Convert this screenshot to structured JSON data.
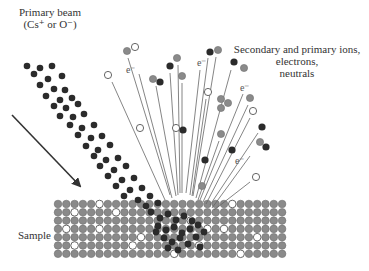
{
  "labels": {
    "primary_beam": "Primary beam",
    "primary_beam_species": "(Cs⁺ or O⁻)",
    "emitted_line1": "Secondary and primary ions,",
    "emitted_line2": "electrons,",
    "emitted_line3": "neutrals",
    "sample": "Sample",
    "electron": "e⁻"
  },
  "colors": {
    "dark_particle": "#2b2b2b",
    "gray_particle": "#8a8a8a",
    "open_particle_stroke": "#555555",
    "trajectory": "#666666",
    "arrow": "#333333"
  },
  "diagram": {
    "beam_arrow": {
      "x1": 12,
      "y1": 115,
      "x2": 80,
      "y2": 186
    },
    "beam_particles": [
      [
        27,
        66
      ],
      [
        40,
        68
      ],
      [
        52,
        66
      ],
      [
        34,
        74
      ],
      [
        48,
        79
      ],
      [
        62,
        76
      ],
      [
        40,
        85
      ],
      [
        54,
        89
      ],
      [
        65,
        90
      ],
      [
        46,
        96
      ],
      [
        60,
        100
      ],
      [
        72,
        98
      ],
      [
        54,
        106
      ],
      [
        66,
        108
      ],
      [
        78,
        104
      ],
      [
        60,
        116
      ],
      [
        73,
        117
      ],
      [
        84,
        114
      ],
      [
        70,
        125
      ],
      [
        82,
        128
      ],
      [
        94,
        125
      ],
      [
        78,
        135
      ],
      [
        91,
        138
      ],
      [
        102,
        136
      ],
      [
        86,
        146
      ],
      [
        98,
        150
      ],
      [
        110,
        145
      ],
      [
        94,
        156
      ],
      [
        106,
        160
      ],
      [
        118,
        158
      ],
      [
        100,
        166
      ],
      [
        114,
        170
      ],
      [
        126,
        166
      ],
      [
        108,
        176
      ],
      [
        122,
        180
      ],
      [
        134,
        178
      ],
      [
        116,
        186
      ],
      [
        130,
        190
      ],
      [
        142,
        188
      ],
      [
        124,
        196
      ],
      [
        138,
        200
      ],
      [
        150,
        196
      ],
      [
        146,
        206
      ],
      [
        158,
        203
      ]
    ],
    "sample": {
      "x": 58,
      "y": 204,
      "cols": 28,
      "rows": 7,
      "pitch": 8.3,
      "r": 3.8,
      "open_cells": [
        [
          5,
          0
        ],
        [
          21,
          0
        ],
        [
          2,
          1
        ],
        [
          7,
          1
        ],
        [
          16,
          2
        ],
        [
          1,
          3
        ],
        [
          5,
          3
        ],
        [
          18,
          3
        ],
        [
          20,
          3
        ],
        [
          10,
          4
        ],
        [
          24,
          4
        ],
        [
          2,
          5
        ],
        [
          9,
          5
        ],
        [
          17,
          5
        ],
        [
          14,
          6
        ],
        [
          22,
          6
        ]
      ],
      "crater_cx": 175,
      "crater_cy": 222,
      "crater_r": 34
    },
    "crater_dark": [
      [
        151,
        212
      ],
      [
        160,
        218
      ],
      [
        168,
        214
      ],
      [
        176,
        220
      ],
      [
        184,
        216
      ],
      [
        192,
        221
      ],
      [
        158,
        226
      ],
      [
        166,
        230
      ],
      [
        174,
        227
      ],
      [
        182,
        233
      ],
      [
        190,
        229
      ],
      [
        198,
        225
      ],
      [
        164,
        238
      ],
      [
        172,
        242
      ],
      [
        180,
        238
      ],
      [
        188,
        244
      ],
      [
        196,
        237
      ],
      [
        156,
        232
      ],
      [
        204,
        232
      ],
      [
        178,
        250
      ],
      [
        168,
        248
      ],
      [
        200,
        247
      ]
    ],
    "emitted": [
      {
        "type": "open",
        "x": 108,
        "y": 75,
        "lx1": 112,
        "ly1": 82,
        "lx2": 165,
        "ly2": 200
      },
      {
        "type": "gray",
        "x": 127,
        "y": 51,
        "lx1": 128,
        "ly1": 58,
        "lx2": 170,
        "ly2": 195
      },
      {
        "type": "open",
        "x": 135,
        "y": 47,
        "lx1": 0,
        "ly1": 0,
        "lx2": 0,
        "ly2": 0
      },
      {
        "type": "electron",
        "x": 131,
        "y": 70,
        "lx1": 139,
        "ly1": 74,
        "lx2": 172,
        "ly2": 198
      },
      {
        "type": "gray",
        "x": 153,
        "y": 79,
        "lx1": 156,
        "ly1": 86,
        "lx2": 176,
        "ly2": 196
      },
      {
        "type": "dark",
        "x": 160,
        "y": 82,
        "lx1": 0,
        "ly1": 0,
        "lx2": 0,
        "ly2": 0
      },
      {
        "type": "dark",
        "x": 170,
        "y": 66,
        "lx1": 170,
        "ly1": 73,
        "lx2": 178,
        "ly2": 195
      },
      {
        "type": "gray",
        "x": 177,
        "y": 58,
        "lx1": 178,
        "ly1": 65,
        "lx2": 180,
        "ly2": 193
      },
      {
        "type": "gray",
        "x": 182,
        "y": 76,
        "lx1": 182,
        "ly1": 83,
        "lx2": 182,
        "ly2": 193
      },
      {
        "type": "open",
        "x": 176,
        "y": 128,
        "lx1": 0,
        "ly1": 0,
        "lx2": 0,
        "ly2": 0
      },
      {
        "type": "dark",
        "x": 183,
        "y": 130,
        "lx1": 0,
        "ly1": 0,
        "lx2": 0,
        "ly2": 0
      },
      {
        "type": "electron",
        "x": 202,
        "y": 63,
        "lx1": 200,
        "ly1": 70,
        "lx2": 186,
        "ly2": 193
      },
      {
        "type": "dark",
        "x": 210,
        "y": 52,
        "lx1": 208,
        "ly1": 58,
        "lx2": 190,
        "ly2": 195
      },
      {
        "type": "gray",
        "x": 218,
        "y": 50,
        "lx1": 216,
        "ly1": 57,
        "lx2": 193,
        "ly2": 196
      },
      {
        "type": "dark",
        "x": 234,
        "y": 62,
        "lx1": 231,
        "ly1": 70,
        "lx2": 196,
        "ly2": 198
      },
      {
        "type": "gray",
        "x": 244,
        "y": 68,
        "lx1": 0,
        "ly1": 0,
        "lx2": 0,
        "ly2": 0
      },
      {
        "type": "open",
        "x": 208,
        "y": 92,
        "lx1": 206,
        "ly1": 99,
        "lx2": 192,
        "ly2": 196
      },
      {
        "type": "gray",
        "x": 221,
        "y": 99,
        "lx1": 0,
        "ly1": 0,
        "lx2": 0,
        "ly2": 0
      },
      {
        "type": "gray",
        "x": 228,
        "y": 103,
        "lx1": 0,
        "ly1": 0,
        "lx2": 0,
        "ly2": 0
      },
      {
        "type": "gray",
        "x": 221,
        "y": 108,
        "lx1": 0,
        "ly1": 0,
        "lx2": 0,
        "ly2": 0
      },
      {
        "type": "electron",
        "x": 245,
        "y": 88,
        "lx1": 243,
        "ly1": 94,
        "lx2": 200,
        "ly2": 200
      },
      {
        "type": "gray",
        "x": 250,
        "y": 98,
        "lx1": 248,
        "ly1": 105,
        "lx2": 203,
        "ly2": 202
      },
      {
        "type": "open",
        "x": 253,
        "y": 111,
        "lx1": 250,
        "ly1": 118,
        "lx2": 206,
        "ly2": 204
      },
      {
        "type": "gray",
        "x": 221,
        "y": 134,
        "lx1": 219,
        "ly1": 141,
        "lx2": 198,
        "ly2": 200
      },
      {
        "type": "dark",
        "x": 262,
        "y": 127,
        "lx1": 258,
        "ly1": 133,
        "lx2": 210,
        "ly2": 205
      },
      {
        "type": "gray",
        "x": 260,
        "y": 142,
        "lx1": 0,
        "ly1": 0,
        "lx2": 0,
        "ly2": 0
      },
      {
        "type": "dark",
        "x": 266,
        "y": 147,
        "lx1": 0,
        "ly1": 0,
        "lx2": 0,
        "ly2": 0
      },
      {
        "type": "dark",
        "x": 232,
        "y": 150,
        "lx1": 0,
        "ly1": 0,
        "lx2": 0,
        "ly2": 0
      },
      {
        "type": "electron",
        "x": 240,
        "y": 161,
        "lx1": 250,
        "ly1": 156,
        "lx2": 212,
        "ly2": 208
      },
      {
        "type": "open",
        "x": 256,
        "y": 177,
        "lx1": 250,
        "ly1": 182,
        "lx2": 214,
        "ly2": 210
      },
      {
        "type": "gray",
        "x": 202,
        "y": 186,
        "lx1": 0,
        "ly1": 0,
        "lx2": 0,
        "ly2": 0
      },
      {
        "type": "dark",
        "x": 205,
        "y": 160,
        "lx1": 0,
        "ly1": 0,
        "lx2": 0,
        "ly2": 0
      },
      {
        "type": "open",
        "x": 140,
        "y": 128,
        "lx1": 0,
        "ly1": 0,
        "lx2": 0,
        "ly2": 0
      }
    ]
  }
}
